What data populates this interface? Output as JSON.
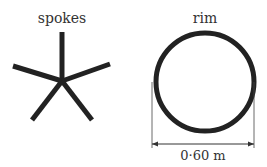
{
  "diagram": {
    "spokes": {
      "label": "spokes",
      "center": [
        62,
        81
      ],
      "endpoints": [
        [
          62,
          32
        ],
        [
          13,
          66
        ],
        [
          110,
          64
        ],
        [
          32,
          120
        ],
        [
          92,
          120
        ]
      ],
      "stroke_color": "#222222",
      "stroke_width": 5
    },
    "rim": {
      "label": "rim",
      "center": [
        205,
        82
      ],
      "radius": 49,
      "stroke_color": "#222222",
      "stroke_width": 5,
      "dimension": {
        "label": "0·60 m",
        "x1": 152,
        "x2": 254,
        "y": 144
      }
    }
  }
}
